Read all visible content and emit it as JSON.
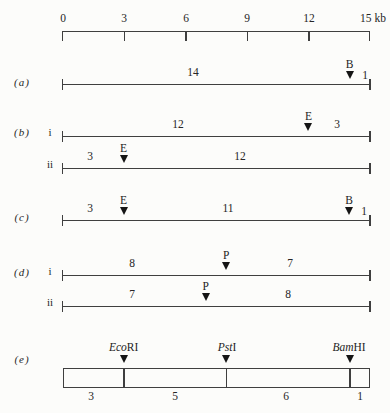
{
  "figure": {
    "scale": {
      "tick_labels": [
        "0",
        "3",
        "6",
        "9",
        "12",
        "15 kb"
      ],
      "tick_kb": [
        0,
        3,
        6,
        9,
        12,
        15
      ],
      "unit": "kb",
      "range_kb": [
        0,
        15
      ]
    },
    "rows": {
      "a": {
        "label": "(a)",
        "maps": [
          {
            "fragments": [
              {
                "label": "14"
              },
              {
                "label": "1"
              }
            ],
            "markers": [
              {
                "enzyme": "B",
                "kb": 14
              }
            ]
          }
        ]
      },
      "b": {
        "label": "(b)",
        "maps": [
          {
            "sub": "i",
            "fragments": [
              {
                "label": "12"
              },
              {
                "label": "3"
              }
            ],
            "markers": [
              {
                "enzyme": "E",
                "kb": 12
              }
            ]
          },
          {
            "sub": "ii",
            "fragments": [
              {
                "label": "3"
              },
              {
                "label": "12"
              }
            ],
            "markers": [
              {
                "enzyme": "E",
                "kb": 3
              }
            ]
          }
        ]
      },
      "c": {
        "label": "(c)",
        "maps": [
          {
            "fragments": [
              {
                "label": "3"
              },
              {
                "label": "11"
              },
              {
                "label": "1"
              }
            ],
            "markers": [
              {
                "enzyme": "E",
                "kb": 3
              },
              {
                "enzyme": "B",
                "kb": 14
              }
            ]
          }
        ]
      },
      "d": {
        "label": "(d)",
        "maps": [
          {
            "sub": "i",
            "fragments": [
              {
                "label": "8"
              },
              {
                "label": "7"
              }
            ],
            "markers": [
              {
                "enzyme": "P",
                "kb": 8
              }
            ]
          },
          {
            "sub": "ii",
            "fragments": [
              {
                "label": "7"
              },
              {
                "label": "8"
              }
            ],
            "markers": [
              {
                "enzyme": "P",
                "kb": 7
              }
            ]
          }
        ]
      },
      "e": {
        "label": "(e)",
        "enzymes": [
          {
            "italic": "Eco",
            "roman": "RI",
            "kb": 3
          },
          {
            "italic": "Pst",
            "roman": "I",
            "kb": 8
          },
          {
            "italic": "Bam",
            "roman": "HI",
            "kb": 14
          }
        ],
        "fragments": [
          {
            "label": "3"
          },
          {
            "label": "5"
          },
          {
            "label": "6"
          },
          {
            "label": "1"
          }
        ]
      }
    }
  }
}
